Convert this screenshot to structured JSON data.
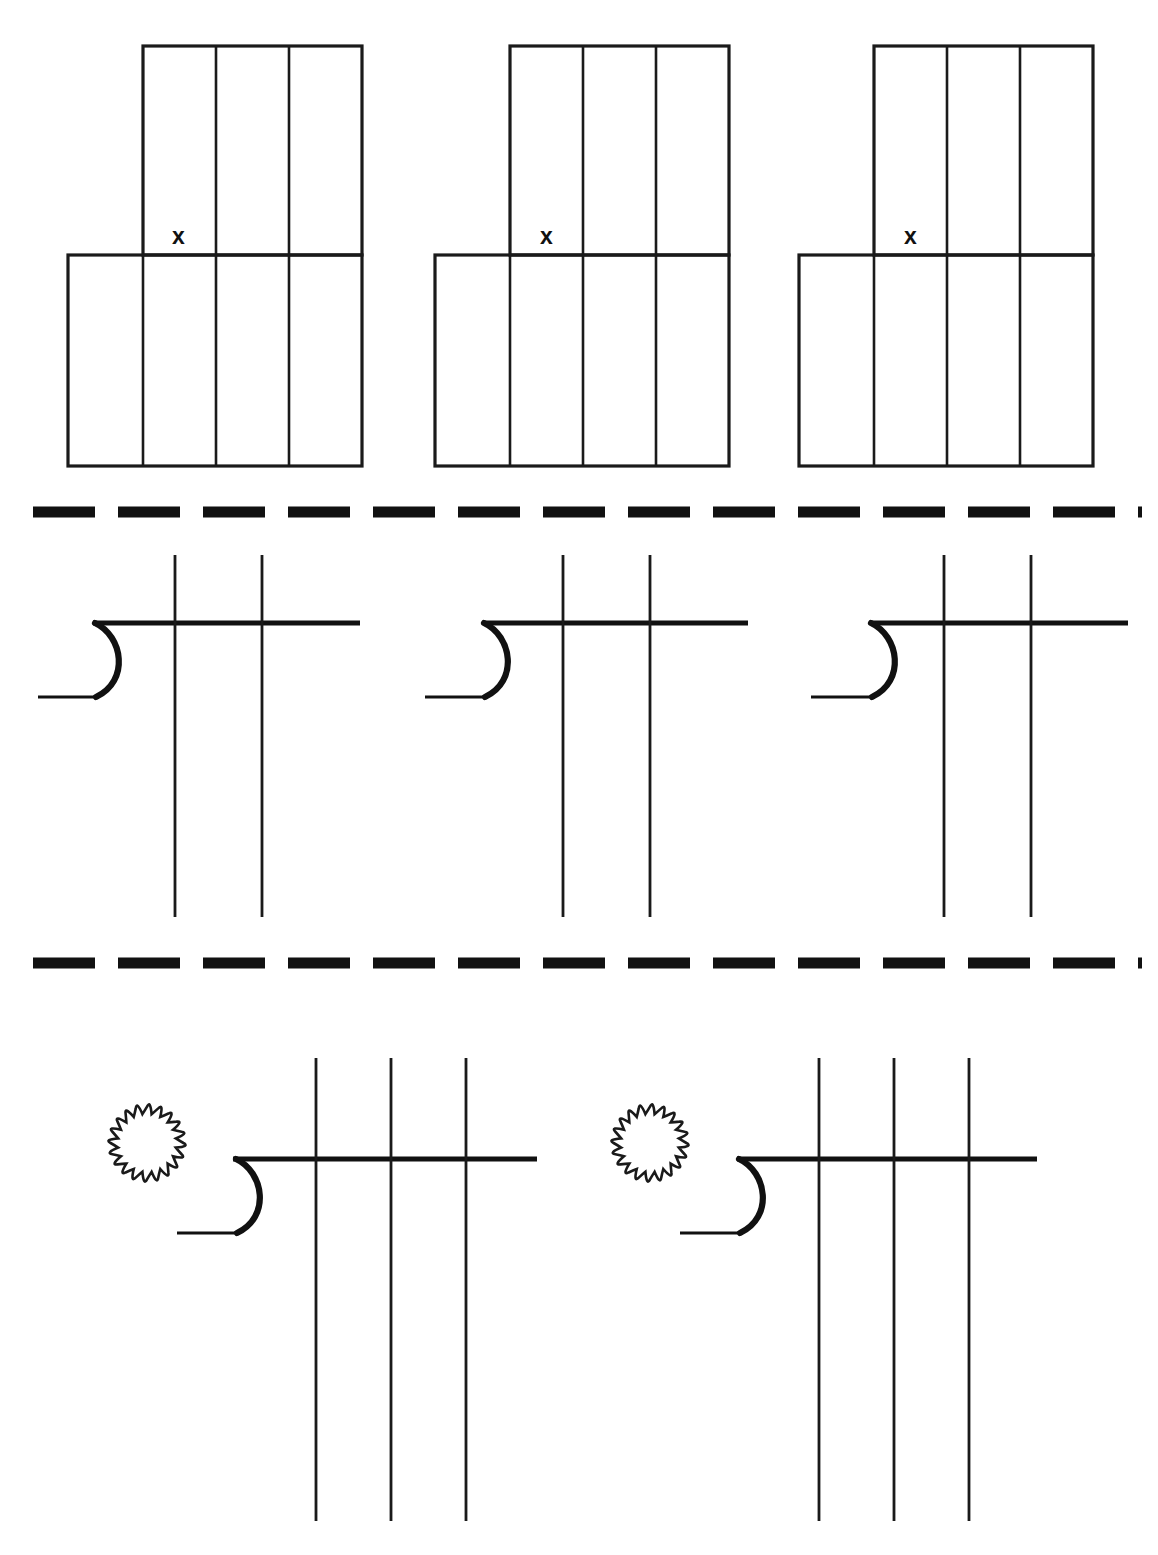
{
  "page": {
    "width": 1158,
    "height": 1555,
    "background_color": "#ffffff",
    "ink_color": "#111111"
  },
  "sections": [
    {
      "id": "place-value-grids",
      "name": "Place Value Grid Row",
      "problem_count": 3,
      "grid": {
        "top_band_columns": 3,
        "bottom_band_columns": 4,
        "marker_label": "x",
        "cell_width": 73,
        "top_band_height": 209,
        "bottom_band_height": 211
      },
      "problems": [
        {
          "index": 1,
          "marker_label": "x",
          "left": 68,
          "top": 46
        },
        {
          "index": 2,
          "marker_label": "x",
          "left": 435,
          "top": 46
        },
        {
          "index": 3,
          "marker_label": "x",
          "left": 799,
          "top": 46
        }
      ]
    },
    {
      "id": "division-frames-row-1",
      "name": "Long Division Frame Row 1",
      "problem_count": 3,
      "vertical_rule_count": 2,
      "has_circle": false,
      "problems": [
        {
          "index": 4,
          "bracket_left": 93,
          "bar_right": 360
        },
        {
          "index": 5,
          "bracket_left": 483,
          "bar_right": 748
        },
        {
          "index": 6,
          "bracket_left": 870,
          "bar_right": 1128
        }
      ]
    },
    {
      "id": "division-frames-row-2",
      "name": "Long Division Frame Row 2",
      "problem_count": 2,
      "vertical_rule_count": 3,
      "has_circle": true,
      "circle": {
        "diameter": 80,
        "scallop_count": 20
      },
      "problems": [
        {
          "index": 7,
          "circle_cx": 147,
          "bracket_left": 233,
          "bar_right": 537
        },
        {
          "index": 8,
          "circle_cx": 650,
          "bracket_left": 737,
          "bar_right": 1037
        }
      ]
    }
  ],
  "separators": [
    {
      "id": "separator-1",
      "y": 512,
      "dash_count": 13,
      "dash_length": 62,
      "gap_length": 23
    },
    {
      "id": "separator-2",
      "y": 963,
      "dash_count": 13,
      "dash_length": 62,
      "gap_length": 23
    }
  ],
  "markers": {
    "x_label": "x"
  }
}
